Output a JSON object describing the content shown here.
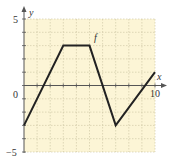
{
  "chart_data": {
    "type": "line",
    "title": "",
    "xlabel": "x",
    "ylabel": "y",
    "function_label": "f",
    "xlim": [
      0,
      10
    ],
    "ylim": [
      -5,
      5
    ],
    "grid": true,
    "x_ticks_labeled": [
      "0",
      "10"
    ],
    "y_ticks_labeled": [
      "5",
      "0",
      "-5"
    ],
    "series": [
      {
        "name": "f",
        "points": [
          [
            0,
            -3
          ],
          [
            3,
            3
          ],
          [
            5,
            3
          ],
          [
            7,
            -3
          ],
          [
            10,
            1
          ]
        ]
      }
    ]
  },
  "labels": {
    "y_axis": "y",
    "x_axis": "x",
    "f": "f",
    "y_top": "5",
    "y_bottom": "−5",
    "origin": "0",
    "x_right": "10"
  },
  "colors": {
    "background_plot": "#fcf5d6",
    "grid": "#c9c29f",
    "axis": "#555555",
    "curve": "#222222"
  }
}
